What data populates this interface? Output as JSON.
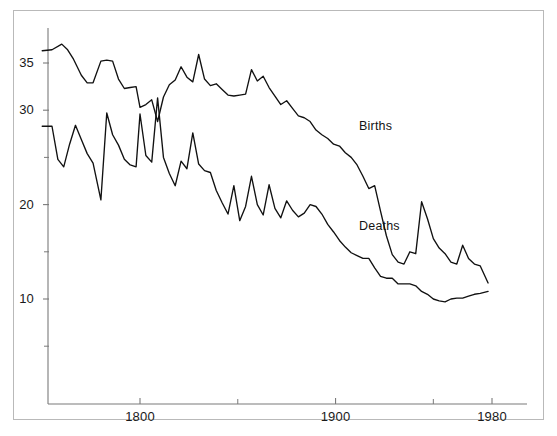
{
  "figure": {
    "frame_color": "#b9b9b9",
    "axis_color": "#7a7a7a",
    "line_color": "#111111",
    "background": "#ffffff"
  },
  "chart_data": {
    "type": "line",
    "title": "",
    "subtitle": "",
    "xlabel": "",
    "ylabel": "",
    "xlim": [
      1748,
      1985
    ],
    "ylim": [
      2,
      38.5
    ],
    "grid": false,
    "legend": "inline-labels",
    "x_ticks_major": [
      1800,
      1900,
      1980
    ],
    "x_tick_labels": [
      "1800",
      "1900",
      "1980"
    ],
    "x_ticks_minor": [
      1850,
      1950
    ],
    "y_ticks_major": [
      10,
      20,
      30,
      35
    ],
    "y_tick_labels": [
      "10",
      "20",
      "30",
      "35"
    ],
    "y_ticks_minor": [
      5,
      15,
      25
    ],
    "annotations": [
      {
        "text": "Births",
        "x": 1912,
        "y": 28.2
      },
      {
        "text": "Deaths",
        "x": 1912,
        "y": 17.6
      }
    ],
    "series": [
      {
        "name": "Births",
        "label": "Births",
        "x": [
          1750,
          1755,
          1760,
          1763,
          1766,
          1770,
          1773,
          1776,
          1780,
          1783,
          1786,
          1789,
          1792,
          1795,
          1798,
          1800,
          1803,
          1806,
          1809,
          1812,
          1815,
          1818,
          1821,
          1824,
          1827,
          1830,
          1833,
          1836,
          1839,
          1842,
          1845,
          1848,
          1851,
          1854,
          1857,
          1860,
          1863,
          1866,
          1869,
          1872,
          1875,
          1878,
          1881,
          1884,
          1887,
          1890,
          1893,
          1896,
          1899,
          1902,
          1905,
          1908,
          1911,
          1914,
          1917,
          1920,
          1923,
          1926,
          1929,
          1932,
          1935,
          1938,
          1941,
          1944,
          1947,
          1950,
          1953,
          1956,
          1959,
          1962,
          1965,
          1968,
          1971,
          1974,
          1978
        ],
        "values": [
          36.3,
          36.4,
          37.0,
          36.4,
          35.4,
          33.7,
          32.9,
          32.9,
          35.2,
          35.3,
          35.2,
          33.3,
          32.3,
          32.4,
          32.5,
          30.3,
          30.6,
          31.1,
          28.8,
          31.4,
          32.7,
          33.2,
          34.6,
          33.5,
          33.0,
          35.9,
          33.3,
          32.6,
          32.8,
          32.2,
          31.6,
          31.5,
          31.6,
          31.7,
          34.3,
          33.1,
          33.6,
          32.4,
          31.5,
          30.6,
          31.0,
          30.2,
          29.4,
          29.2,
          28.8,
          27.9,
          27.4,
          27.0,
          26.4,
          26.2,
          25.5,
          25.0,
          24.2,
          23.0,
          21.7,
          22.0,
          19.3,
          16.7,
          14.7,
          13.9,
          13.7,
          15.0,
          14.8,
          20.3,
          18.5,
          16.4,
          15.4,
          14.8,
          13.9,
          13.7,
          15.7,
          14.3,
          13.7,
          13.5,
          11.7
        ],
        "unit": "per 1000 population"
      },
      {
        "name": "Deaths",
        "label": "Deaths",
        "x": [
          1750,
          1755,
          1758,
          1761,
          1764,
          1767,
          1770,
          1773,
          1776,
          1780,
          1783,
          1786,
          1789,
          1792,
          1795,
          1798,
          1800,
          1803,
          1806,
          1809,
          1812,
          1815,
          1818,
          1821,
          1824,
          1827,
          1830,
          1833,
          1836,
          1839,
          1842,
          1845,
          1848,
          1851,
          1854,
          1857,
          1860,
          1863,
          1866,
          1869,
          1872,
          1875,
          1878,
          1881,
          1884,
          1887,
          1890,
          1893,
          1896,
          1899,
          1902,
          1905,
          1908,
          1911,
          1914,
          1917,
          1920,
          1923,
          1926,
          1929,
          1932,
          1935,
          1938,
          1941,
          1944,
          1947,
          1950,
          1953,
          1956,
          1959,
          1962,
          1965,
          1968,
          1971,
          1974,
          1978
        ],
        "values": [
          28.3,
          28.3,
          24.8,
          24.0,
          26.4,
          28.4,
          26.9,
          25.4,
          24.4,
          20.5,
          29.7,
          27.4,
          26.3,
          24.8,
          24.2,
          24.0,
          29.6,
          25.2,
          24.5,
          31.3,
          25.0,
          23.3,
          22.0,
          24.6,
          23.8,
          27.6,
          24.3,
          23.6,
          23.4,
          21.5,
          20.2,
          19.0,
          22.0,
          18.3,
          19.8,
          23.0,
          20.0,
          18.9,
          22.1,
          19.6,
          18.6,
          20.4,
          19.4,
          18.7,
          19.1,
          20.0,
          19.8,
          19.0,
          17.9,
          17.1,
          16.2,
          15.5,
          14.9,
          14.6,
          14.3,
          14.3,
          13.3,
          12.4,
          12.2,
          12.2,
          11.6,
          11.6,
          11.6,
          11.4,
          10.8,
          10.5,
          10.0,
          9.8,
          9.7,
          10.0,
          10.1,
          10.1,
          10.3,
          10.5,
          10.6,
          10.8
        ],
        "unit": "per 1000 population"
      }
    ]
  }
}
